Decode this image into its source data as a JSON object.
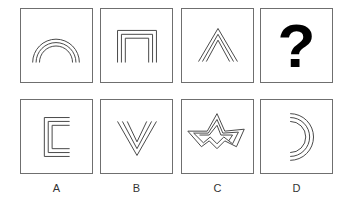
{
  "puzzle": {
    "top_row": [
      {
        "shape": "triple-arch",
        "description": "three concentric semicircular arcs opening downward"
      },
      {
        "shape": "triple-square-bracket-up",
        "description": "three nested rectangular bracket lines opening downward"
      },
      {
        "shape": "triple-caret",
        "description": "three nested inverted-V lines pointing up"
      },
      {
        "shape": "question-mark",
        "text": "?"
      }
    ],
    "options": [
      {
        "label": "A",
        "shape": "triple-square-bracket-left",
        "description": "three nested C-shaped rectangular brackets opening right"
      },
      {
        "label": "B",
        "shape": "triple-v",
        "description": "three nested V lines pointing down"
      },
      {
        "label": "C",
        "shape": "triple-crown-star",
        "description": "three nested zigzag crown/star outlines"
      },
      {
        "label": "D",
        "shape": "triple-arc-right",
        "description": "three concentric arcs opening left"
      }
    ]
  },
  "colors": {
    "line": "#444444",
    "border": "#6f6f6f",
    "question": "#000000"
  }
}
